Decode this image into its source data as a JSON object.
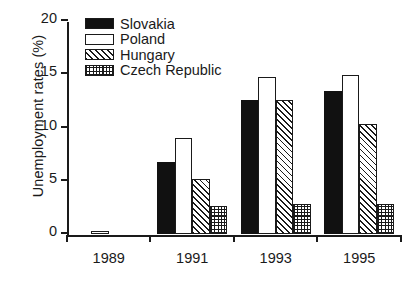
{
  "chart_data": {
    "type": "bar",
    "title": "",
    "xlabel": "",
    "ylabel": "Unemployment rates (%)",
    "categories": [
      "1989",
      "1991",
      "1993",
      "1995"
    ],
    "ylim": [
      0,
      20
    ],
    "yticks": [
      0,
      5,
      10,
      15,
      20
    ],
    "ytick_labels": [
      "0",
      "5",
      "10",
      "15",
      "20"
    ],
    "grid": false,
    "legend_position": "top-left",
    "series": [
      {
        "name": "Slovakia",
        "pattern": "solid-black",
        "color": "#111111",
        "values": [
          0,
          6.8,
          12.6,
          13.4
        ]
      },
      {
        "name": "Poland",
        "pattern": "open-white",
        "color": "#ffffff",
        "values": [
          0.3,
          9.0,
          14.7,
          14.9
        ]
      },
      {
        "name": "Hungary",
        "pattern": "diagonal-hatch",
        "color": "#ffffff",
        "values": [
          0,
          5.2,
          12.6,
          10.3
        ]
      },
      {
        "name": "Czech Republic",
        "pattern": "checkered",
        "color": "#ffffff",
        "values": [
          0,
          2.6,
          2.8,
          2.8
        ]
      }
    ]
  }
}
